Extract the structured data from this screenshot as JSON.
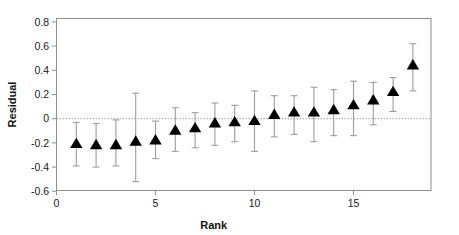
{
  "chart_data": {
    "type": "scatter",
    "title": "",
    "xlabel": "Rank",
    "ylabel": "Residual",
    "xlim": [
      0,
      18.8
    ],
    "ylim": [
      -0.72,
      0.88
    ],
    "xticks": [
      0,
      5,
      10,
      15
    ],
    "xticklabels": [
      "0",
      "5",
      "10",
      "15"
    ],
    "yticks": [
      0.8,
      0.6,
      0.4,
      0.2,
      0,
      -0.2,
      -0.4,
      -0.6
    ],
    "yticklabels": [
      "0.8",
      "0.6",
      "0.4",
      "0.2",
      "0",
      "-0.2",
      "-0.4",
      "-0.6"
    ],
    "grid": false,
    "legend": null,
    "reference_line": {
      "y": 0,
      "style": "dotted",
      "color": "#9b9b9b"
    },
    "marker_style": "triangle-up",
    "marker_color": "#000000",
    "errorbar_color": "#9d9d9d",
    "x": [
      1,
      2,
      3,
      4,
      5,
      6,
      7,
      8,
      9,
      10,
      11,
      12,
      13,
      14,
      15,
      16,
      17,
      18
    ],
    "values": [
      -0.21,
      -0.22,
      -0.22,
      -0.19,
      -0.18,
      -0.1,
      -0.08,
      -0.04,
      -0.03,
      -0.02,
      0.03,
      0.05,
      0.05,
      0.07,
      0.11,
      0.15,
      0.22,
      0.44
    ],
    "err_low": [
      -0.39,
      -0.4,
      -0.39,
      -0.52,
      -0.33,
      -0.27,
      -0.24,
      -0.22,
      -0.19,
      -0.27,
      -0.15,
      -0.13,
      -0.19,
      -0.14,
      -0.14,
      -0.05,
      0.06,
      0.23
    ],
    "err_high": [
      -0.03,
      -0.04,
      -0.01,
      0.21,
      -0.02,
      0.09,
      0.05,
      0.13,
      0.11,
      0.23,
      0.19,
      0.19,
      0.26,
      0.24,
      0.31,
      0.3,
      0.34,
      0.62
    ]
  },
  "axes": {
    "x_title": "Rank",
    "y_title": "Residual"
  }
}
